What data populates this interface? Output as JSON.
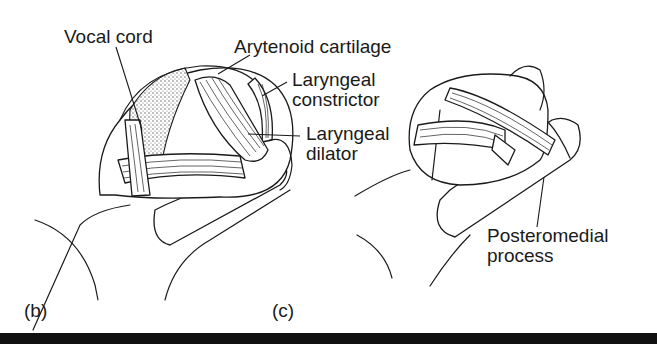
{
  "figure": {
    "panels": [
      {
        "id": "b",
        "letter": "(b)",
        "labels": [
          {
            "text": "Vocal cord"
          },
          {
            "text": "Arytenoid cartilage"
          },
          {
            "line1": "Laryngeal",
            "line2": "constrictor"
          },
          {
            "line1": "Laryngeal",
            "line2": "dilator"
          }
        ]
      },
      {
        "id": "c",
        "letter": "(c)",
        "labels": [
          {
            "line1": "Posteromedial",
            "line2": "process"
          }
        ]
      }
    ],
    "colors": {
      "ink": "#1a1a1a",
      "background": "#ffffff",
      "bottom_bar": "#111111",
      "vocal_cord_stipple": "#9a9a9a"
    }
  }
}
